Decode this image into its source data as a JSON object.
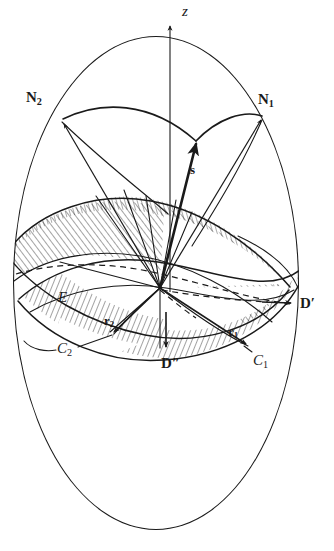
{
  "figure": {
    "type": "geometric-diagram",
    "width": 334,
    "height": 551,
    "background_color": "#ffffff",
    "ink_color": "#1a1a1a"
  },
  "labels": {
    "z_axis": {
      "text": "z",
      "style": "italic",
      "x": 182,
      "y": 8
    },
    "n2": {
      "text": "N",
      "subscript": "2",
      "style": "bold",
      "x": 26,
      "y": 93
    },
    "n1": {
      "text": "N",
      "subscript": "1",
      "style": "bold",
      "x": 258,
      "y": 95
    },
    "s": {
      "text": "s",
      "style": "bold",
      "x": 190,
      "y": 167
    },
    "e": {
      "text": "E",
      "style": "italic",
      "x": 58,
      "y": 294
    },
    "r2": {
      "text": "r",
      "subscript": "2",
      "style": "bold",
      "x": 104,
      "y": 318
    },
    "r1": {
      "text": "r",
      "subscript": "1",
      "style": "bold",
      "x": 228,
      "y": 329
    },
    "c2": {
      "text": "C",
      "subscript": "2",
      "style": "italic",
      "x": 57,
      "y": 345
    },
    "c1": {
      "text": "C",
      "subscript": "1",
      "style": "italic",
      "x": 253,
      "y": 357
    },
    "d_prime": {
      "text": "D",
      "prime": "′",
      "style": "bold",
      "x": 300,
      "y": 300
    },
    "d_double_prime": {
      "text": "D",
      "prime": "″",
      "style": "bold",
      "x": 161,
      "y": 360
    }
  },
  "geometry": {
    "outer_ellipse": {
      "cx": 156,
      "cy": 283,
      "rx": 144,
      "ry": 248
    },
    "origin": {
      "x": 160,
      "y": 288
    },
    "z_axis_top": {
      "x": 170,
      "y": 22
    },
    "pole_n1": {
      "x": 262,
      "y": 117
    },
    "pole_n2": {
      "x": 62,
      "y": 120
    },
    "s_tip": {
      "x": 196,
      "y": 141
    },
    "point_d_prime": {
      "x": 290,
      "y": 303
    },
    "point_d_double_prime": {
      "x": 166,
      "y": 345
    },
    "point_c1": {
      "x": 246,
      "y": 348
    },
    "point_c2": {
      "x": 113,
      "y": 334
    },
    "hatch_angle_left": "-36deg",
    "hatch_angle_right": "20deg",
    "hatch_spacing_px": 4
  }
}
